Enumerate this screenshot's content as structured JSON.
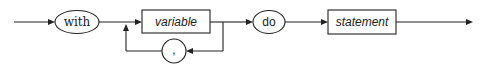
{
  "diagram": {
    "type": "syntax-diagram",
    "statement": "with statement",
    "nodes": [
      {
        "id": "with",
        "kind": "terminal",
        "shape": "ellipse",
        "label": "with"
      },
      {
        "id": "variable",
        "kind": "nonterminal",
        "shape": "rectangle",
        "label": "variable"
      },
      {
        "id": "comma",
        "kind": "terminal",
        "shape": "circle",
        "label": ","
      },
      {
        "id": "do",
        "kind": "terminal",
        "shape": "ellipse",
        "label": "do"
      },
      {
        "id": "statement",
        "kind": "nonterminal",
        "shape": "rectangle",
        "label": "statement"
      }
    ],
    "edges": [
      {
        "from": "entry",
        "to": "with"
      },
      {
        "from": "with",
        "to": "variable"
      },
      {
        "from": "variable",
        "to": "comma",
        "note": "loop back"
      },
      {
        "from": "comma",
        "to": "variable",
        "note": "repeat"
      },
      {
        "from": "variable",
        "to": "do"
      },
      {
        "from": "do",
        "to": "statement"
      },
      {
        "from": "statement",
        "to": "exit"
      }
    ]
  }
}
